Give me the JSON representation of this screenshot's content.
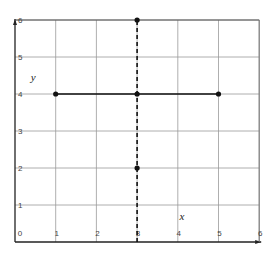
{
  "chart_data": {
    "type": "line",
    "title": "",
    "xlabel": "x",
    "ylabel": "y",
    "xlim": [
      0,
      6
    ],
    "ylim": [
      0,
      6
    ],
    "grid": true,
    "x_ticks": [
      "0",
      "1",
      "2",
      "3",
      "4",
      "5",
      "6"
    ],
    "y_ticks": [
      "1",
      "2",
      "3",
      "4",
      "5",
      "6"
    ],
    "series": [
      {
        "name": "horizontal segment y=4",
        "style": "solid",
        "points": [
          [
            1,
            4
          ],
          [
            3,
            4
          ],
          [
            5,
            4
          ]
        ]
      },
      {
        "name": "vertical line x=3",
        "style": "dashed",
        "points": [
          [
            3,
            2
          ],
          [
            3,
            6
          ]
        ],
        "extends_from": 0
      }
    ],
    "marked_points": [
      [
        1,
        4
      ],
      [
        3,
        4
      ],
      [
        5,
        4
      ],
      [
        3,
        2
      ],
      [
        3,
        6
      ]
    ]
  },
  "colors": {
    "axis": "#222222",
    "grid": "#9a9a9a",
    "line": "#111111"
  }
}
